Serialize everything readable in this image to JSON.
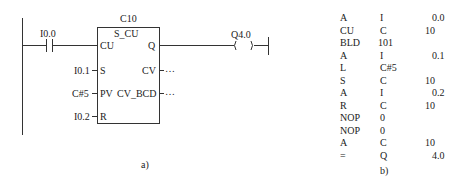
{
  "ladder": {
    "block_name": "C10",
    "block_type": "S_CU",
    "contact_label": "I0.0",
    "coil_label": "Q4.0",
    "pins_left": [
      "CU",
      "S",
      "PV",
      "R"
    ],
    "pins_right": [
      "Q",
      "CV",
      "CV_BCD"
    ],
    "inputs": {
      "S": "I0.1",
      "PV": "C#5",
      "R": "I0.2"
    },
    "outputs": {
      "CV": "…",
      "CV_BCD": "…"
    },
    "caption": "a)"
  },
  "stl": {
    "rows": [
      [
        "A",
        "I",
        "0.0"
      ],
      [
        "CU",
        "C",
        "10"
      ],
      [
        "BLD",
        "101",
        ""
      ],
      [
        "A",
        "I",
        "0.1"
      ],
      [
        "L",
        "C#5",
        ""
      ],
      [
        "S",
        "C",
        "10"
      ],
      [
        "A",
        "I",
        "0.2"
      ],
      [
        "R",
        "C",
        "10"
      ],
      [
        "NOP",
        "0",
        ""
      ],
      [
        "NOP",
        "0",
        ""
      ],
      [
        "A",
        "C",
        "10"
      ],
      [
        "=",
        "Q",
        "4.0"
      ]
    ],
    "caption": "b)"
  }
}
